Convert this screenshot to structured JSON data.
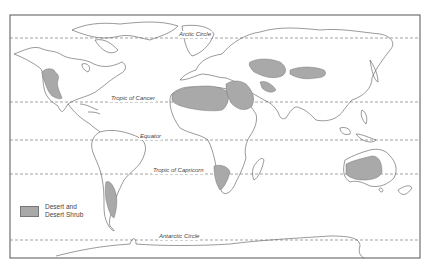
{
  "map": {
    "title": "World Desert and Desert Shrub Regions",
    "latitude_lines": [
      {
        "name": "Arctic Circle",
        "y": 38
      },
      {
        "name": "Tropic of Cancer",
        "y": 102
      },
      {
        "name": "Equator",
        "y": 140
      },
      {
        "name": "Tropic of Capricorn",
        "y": 174
      },
      {
        "name": "Antarctic Circle",
        "y": 240
      }
    ],
    "labels": {
      "arctic": "Arctic Circle",
      "cancer": "Tropic of Cancer",
      "equator": "Equator",
      "capricorn": "Tropic of Capricorn",
      "antarctic": "Antarctic Circle"
    },
    "legend": {
      "line1": "Desert and",
      "line2": "Desert Shrub",
      "color": "#a9a9a9"
    },
    "colors": {
      "outline": "#555555",
      "desert": "#a9a9a9",
      "frame": "#444444"
    }
  }
}
